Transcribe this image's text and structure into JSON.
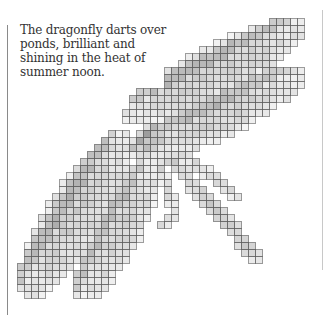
{
  "caption": {
    "lines": [
      "The dragonfly darts over",
      "ponds, brilliant and",
      "shining in the heat of",
      "summer noon."
    ]
  },
  "artwork": {
    "subject": "pixelated dragonfly",
    "cell_size": 7,
    "grid_origin": [
      3,
      4
    ],
    "ink_color": "#6e6e6e",
    "line_color": "#5a5a5a",
    "shapes": [
      {
        "name": "upper-right-wing-1",
        "type": "ellipse",
        "cx": 213,
        "cy": 72,
        "rx": 102,
        "ry": 26,
        "angle": -28,
        "shade": 0.32,
        "vein": 0.55
      },
      {
        "name": "upper-right-wing-2",
        "type": "ellipse",
        "cx": 222,
        "cy": 112,
        "rx": 92,
        "ry": 24,
        "angle": -26,
        "shade": 0.3,
        "vein": 0.5
      },
      {
        "name": "lower-left-wing-1",
        "type": "ellipse",
        "cx": 76,
        "cy": 214,
        "rx": 98,
        "ry": 30,
        "angle": -58,
        "shade": 0.32,
        "vein": 0.55
      },
      {
        "name": "lower-left-wing-2",
        "type": "ellipse",
        "cx": 118,
        "cy": 228,
        "rx": 82,
        "ry": 24,
        "angle": -62,
        "shade": 0.3,
        "vein": 0.5
      },
      {
        "name": "thorax",
        "type": "ellipse",
        "cx": 150,
        "cy": 140,
        "rx": 22,
        "ry": 14,
        "angle": -40,
        "shade": 0.45,
        "vein": 0.6
      },
      {
        "name": "abdomen",
        "type": "segment",
        "x1": 170,
        "y1": 158,
        "x2": 255,
        "y2": 255,
        "width": 7,
        "shade": 0.35
      },
      {
        "name": "leg-1",
        "type": "segment",
        "x1": 178,
        "y1": 150,
        "x2": 235,
        "y2": 195,
        "width": 5,
        "shade": 0.28
      },
      {
        "name": "leg-2",
        "type": "segment",
        "x1": 160,
        "y1": 165,
        "x2": 175,
        "y2": 215,
        "width": 5,
        "shade": 0.28
      },
      {
        "name": "leg-3",
        "type": "segment",
        "x1": 175,
        "y1": 215,
        "x2": 160,
        "y2": 225,
        "width": 5,
        "shade": 0.25
      }
    ]
  }
}
